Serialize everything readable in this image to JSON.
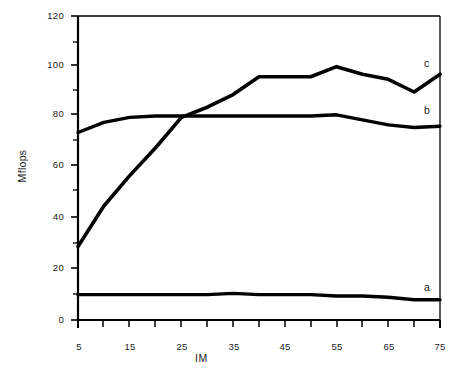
{
  "chart_data": {
    "type": "line",
    "title": "",
    "xlabel": "IM",
    "ylabel": "Mflops",
    "xlim": [
      5,
      75
    ],
    "ylim": [
      0,
      120
    ],
    "grid": false,
    "legend_position": "inline-right-end-labels",
    "x_ticks_major": [
      5,
      15,
      25,
      35,
      45,
      55,
      65,
      75
    ],
    "x_ticks_minor_step": 5,
    "y_ticks_major": [
      0,
      20,
      40,
      60,
      80,
      100,
      120
    ],
    "y_ticks_minor_step": 10,
    "x": [
      5,
      10,
      15,
      20,
      25,
      30,
      35,
      40,
      45,
      50,
      55,
      60,
      65,
      70,
      75
    ],
    "series": [
      {
        "name": "a",
        "label": "a",
        "color": "#000000",
        "values": [
          10,
          10,
          10,
          10,
          10,
          10,
          10.5,
          10,
          10,
          10,
          9.5,
          9.5,
          9,
          8,
          8
        ]
      },
      {
        "name": "b",
        "label": "b",
        "color": "#000000",
        "values": [
          74,
          78,
          80,
          80.5,
          80.5,
          80.5,
          80.5,
          80.5,
          80.5,
          80.5,
          81,
          79,
          77,
          76,
          76.5
        ]
      },
      {
        "name": "c",
        "label": "c",
        "color": "#000000",
        "values": [
          29,
          45,
          57,
          68,
          80,
          84,
          89,
          96,
          96,
          96,
          100,
          97,
          95,
          90,
          97
        ]
      }
    ]
  },
  "axis_tick_labels": {
    "y": [
      "120",
      "100",
      "80",
      "60",
      "40",
      "20",
      "0"
    ],
    "x": [
      "5",
      "15",
      "25",
      "35",
      "45",
      "55",
      "65",
      "75"
    ]
  },
  "axis_titles": {
    "y": "Mflops",
    "x": "IM"
  },
  "series_labels": {
    "a": "a",
    "b": "b",
    "c": "c"
  },
  "colors": {
    "axis": "#000000",
    "line": "#000000",
    "background": "#ffffff",
    "text": "#1a1a1a"
  }
}
